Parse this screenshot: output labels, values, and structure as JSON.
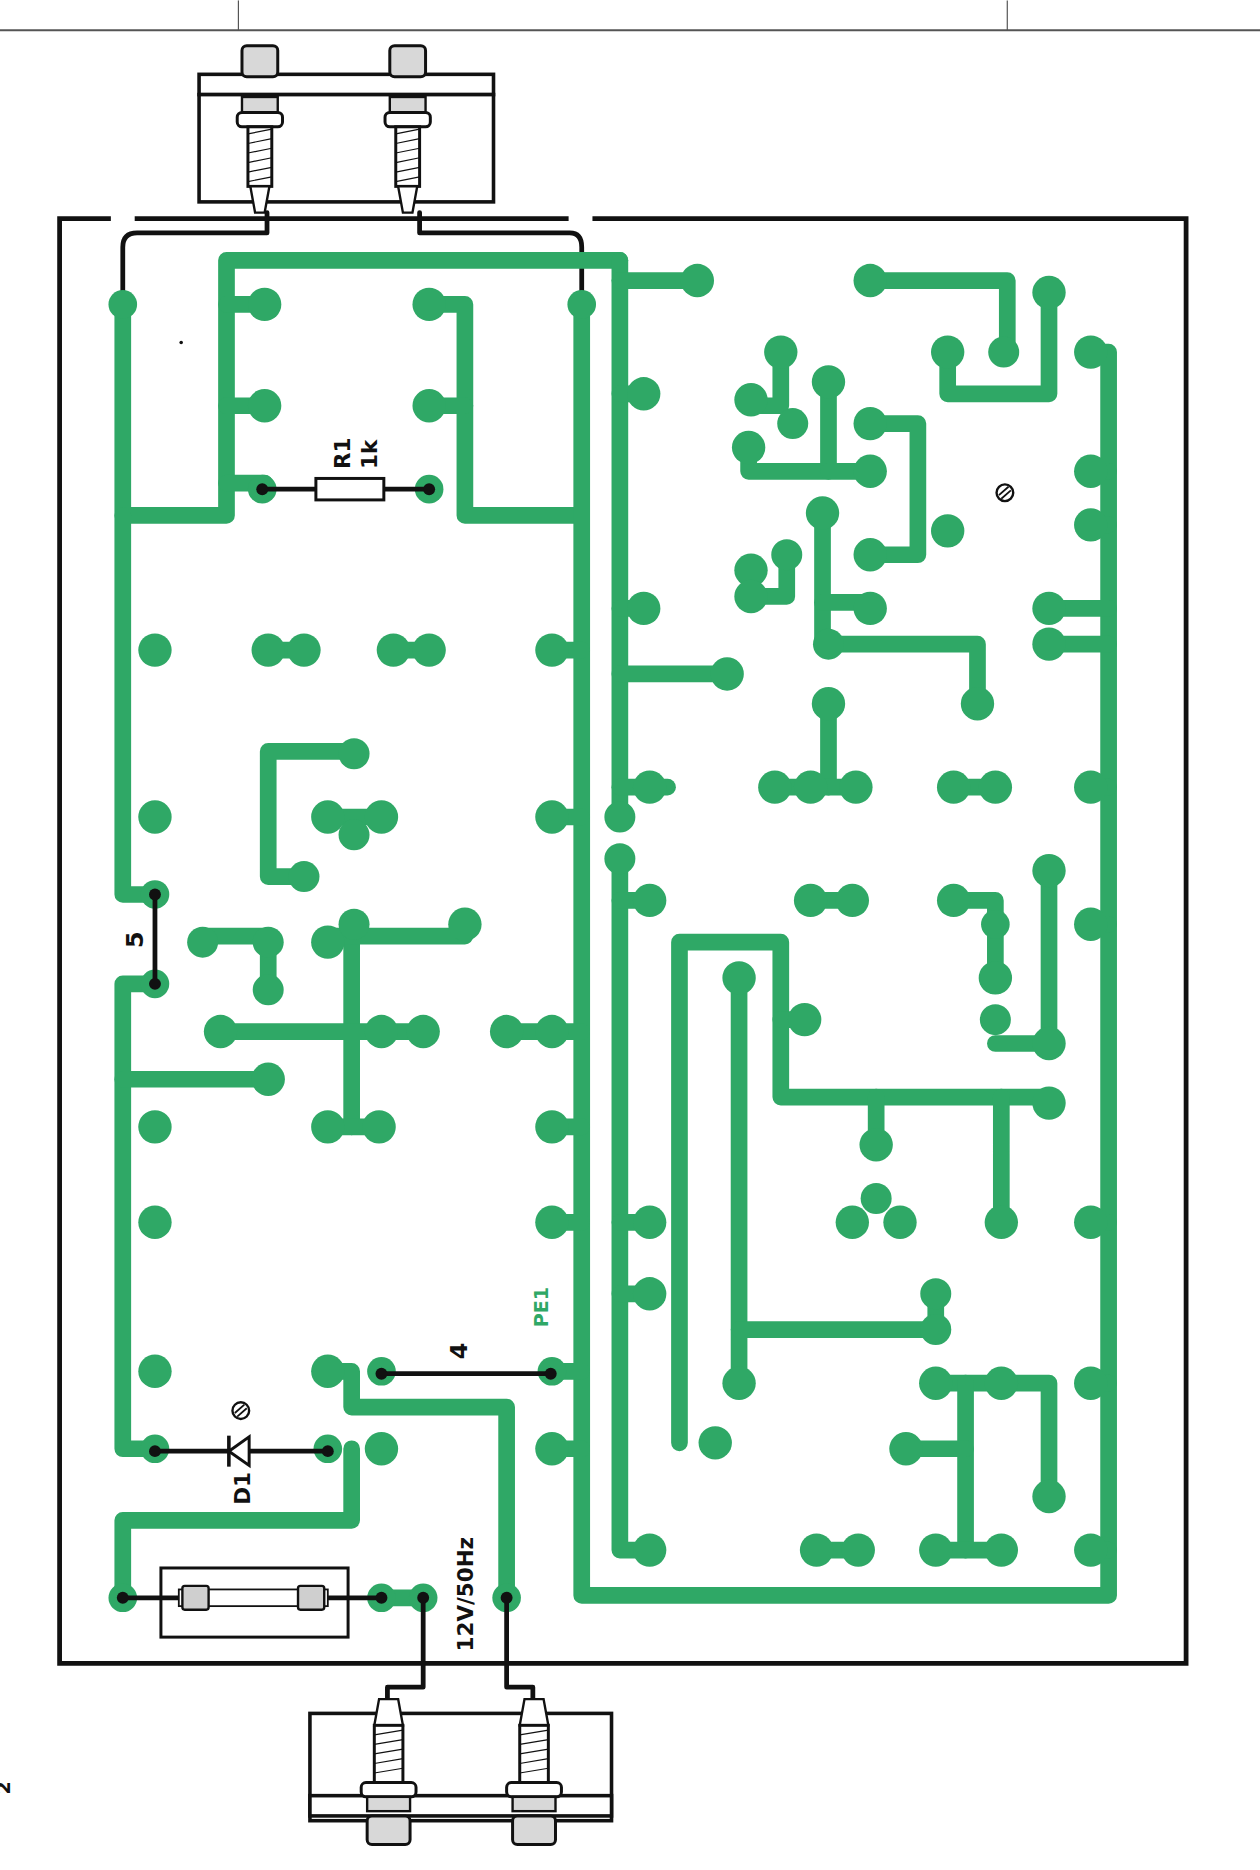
{
  "diagram": {
    "type": "pcb-component-layout",
    "colors": {
      "copper": "#2fa866",
      "ink": "#111111",
      "background": "#ffffff"
    },
    "labels": {
      "resistor_ref": "R1",
      "resistor_value": "1k",
      "diode_ref": "D1",
      "test_point": "PE1",
      "jumper_5": "5",
      "jumper_4": "4",
      "power_input": "12V/50Hz",
      "page_mark": "2"
    },
    "components": [
      {
        "ref": "R1",
        "value": "1k",
        "kind": "resistor"
      },
      {
        "ref": "D1",
        "kind": "diode"
      },
      {
        "ref": "F",
        "kind": "fuse"
      },
      {
        "ref": "J-top",
        "kind": "banana-socket-pair",
        "position": "top"
      },
      {
        "ref": "J-bottom",
        "kind": "banana-socket-pair",
        "position": "bottom"
      }
    ],
    "jumpers": [
      "5",
      "4"
    ],
    "marks": [
      "polarity-mark-upper-right",
      "polarity-mark-diode"
    ]
  }
}
